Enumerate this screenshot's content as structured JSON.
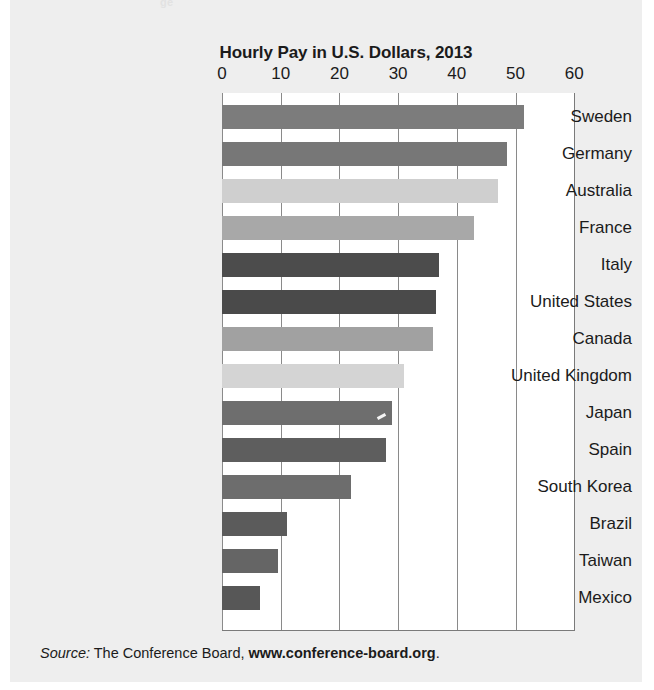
{
  "top_clipped_text": "ge",
  "source": {
    "label": "Source:",
    "text": " The Conference Board, ",
    "url": "www.conference-board.org",
    "period": "."
  },
  "colors": {
    "panel_background": "#eeeeee",
    "plot_background": "#ffffff",
    "axis_line": "#8a8a8a",
    "text": "#1b1b1b"
  },
  "chart_data": {
    "type": "bar",
    "orientation": "horizontal",
    "title": "Hourly Pay in U.S. Dollars, 2013",
    "xlabel": "",
    "ylabel": "",
    "xlim": [
      0,
      60
    ],
    "xticks": [
      0,
      10,
      20,
      30,
      40,
      50,
      60
    ],
    "xticklabels": [
      "0",
      "10",
      "20",
      "30",
      "40",
      "50",
      "60"
    ],
    "grid": true,
    "legend": "none",
    "categories": [
      "Sweden",
      "Germany",
      "Australia",
      "France",
      "Italy",
      "United States",
      "Canada",
      "United Kingdom",
      "Japan",
      "Spain",
      "South Korea",
      "Brazil",
      "Taiwan",
      "Mexico"
    ],
    "values": [
      51.5,
      48.5,
      47,
      43,
      37,
      36.5,
      36,
      31,
      29,
      28,
      22,
      11,
      9.5,
      6.5
    ],
    "bar_colors": [
      "#7c7c7c",
      "#777777",
      "#cfcfcf",
      "#a8a8a8",
      "#4c4c4c",
      "#4a4a4a",
      "#a1a1a1",
      "#d4d4d4",
      "#6e6e6e",
      "#5e5e5e",
      "#6d6d6d",
      "#5b5b5b",
      "#656565",
      "#575757"
    ]
  }
}
